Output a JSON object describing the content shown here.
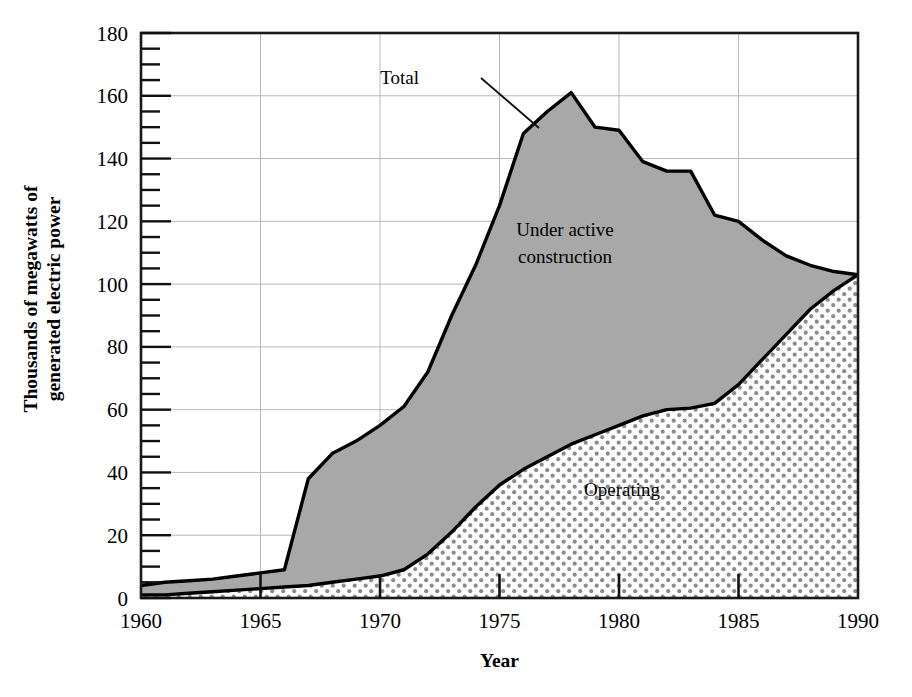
{
  "chart_data": {
    "type": "area",
    "title": "",
    "xlabel": "Year",
    "ylabel": "Thousands of megawatts of generated electric power",
    "ylabel_line1": "Thousands of megawatts of",
    "ylabel_line2": "generated electric power",
    "xlim": [
      1960,
      1990
    ],
    "ylim": [
      0,
      180
    ],
    "x_ticks": [
      1960,
      1965,
      1970,
      1975,
      1980,
      1985,
      1990
    ],
    "x_tick_labels": [
      "1960",
      "1965",
      "1970",
      "1975",
      "1980",
      "1985",
      "1990"
    ],
    "y_ticks": [
      0,
      20,
      40,
      60,
      80,
      100,
      120,
      140,
      160,
      180
    ],
    "y_tick_labels": [
      "0",
      "20",
      "40",
      "60",
      "80",
      "100",
      "120",
      "140",
      "160",
      "180"
    ],
    "y_minor_tick_step": 5,
    "grid": "horizontal and vertical gridlines at major ticks, light gray",
    "stacked": true,
    "legend": "inline annotations",
    "annotations": [
      {
        "text": "Total",
        "target": "upper boundary curve",
        "has_leader_line": true
      },
      {
        "text": "Under active construction",
        "line1": "Under active",
        "line2": "construction",
        "region": "gray band between Operating and Total"
      },
      {
        "text": "Operating",
        "region": "dotted stipple band below Operating curve"
      }
    ],
    "series": [
      {
        "name": "Operating",
        "fill": "white with gray dot stipple pattern",
        "x": [
          1960,
          1961,
          1962,
          1963,
          1964,
          1965,
          1966,
          1967,
          1968,
          1969,
          1970,
          1971,
          1972,
          1973,
          1974,
          1975,
          1976,
          1977,
          1978,
          1979,
          1980,
          1981,
          1982,
          1983,
          1984,
          1985,
          1986,
          1987,
          1988,
          1989,
          1990
        ],
        "values": [
          1,
          1,
          1.5,
          2,
          2.5,
          3,
          3.5,
          4,
          5,
          6,
          7,
          9,
          14,
          21,
          29,
          36,
          41,
          45,
          49,
          52,
          55,
          58,
          60,
          60.5,
          62,
          68,
          76,
          84,
          92,
          98,
          103
        ]
      },
      {
        "name": "Total",
        "fill": "solid gray",
        "x": [
          1960,
          1961,
          1962,
          1963,
          1964,
          1965,
          1966,
          1967,
          1968,
          1969,
          1970,
          1971,
          1972,
          1973,
          1974,
          1975,
          1976,
          1977,
          1978,
          1979,
          1980,
          1981,
          1982,
          1983,
          1984,
          1985,
          1986,
          1987,
          1988,
          1989,
          1990
        ],
        "values": [
          4,
          5,
          5.5,
          6,
          7,
          8,
          9,
          38,
          46,
          50,
          55,
          61,
          72,
          90,
          106,
          125,
          148,
          155,
          161,
          150,
          149,
          139,
          136,
          136,
          122,
          120,
          114,
          109,
          106,
          104,
          103
        ]
      }
    ]
  },
  "annotations": {
    "total_label": "Total",
    "under_construction_line1": "Under active",
    "under_construction_line2": "construction",
    "operating_label": "Operating"
  },
  "axes": {
    "x_title": "Year",
    "y_title_line1": "Thousands of megawatts of",
    "y_title_line2": "generated electric power"
  },
  "colors": {
    "construction_fill": "#a8a8a8",
    "operating_dot": "#8c8c8c",
    "curve_stroke": "#000000",
    "grid": "#b9b9b9",
    "axis": "#1a1a1a",
    "background": "#ffffff"
  }
}
